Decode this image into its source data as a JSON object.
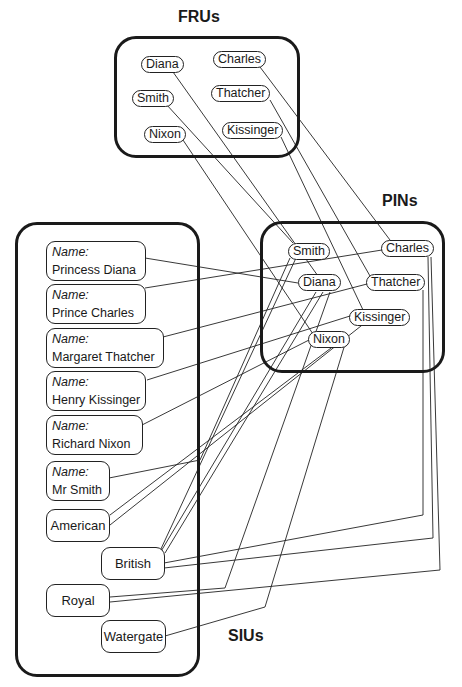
{
  "groups": {
    "frus": {
      "title": "FRUs"
    },
    "pins": {
      "title": "PINs"
    },
    "sius": {
      "title": "SIUs"
    }
  },
  "frus": {
    "diana": "Diana",
    "charles": "Charles",
    "smith": "Smith",
    "thatcher": "Thatcher",
    "nixon": "Nixon",
    "kissinger": "Kissinger"
  },
  "pins": {
    "smith": "Smith",
    "charles": "Charles",
    "diana": "Diana",
    "thatcher": "Thatcher",
    "kissinger": "Kissinger",
    "nixon": "Nixon"
  },
  "sius": {
    "name_label": "Name:",
    "names": [
      "Princess Diana",
      "Prince Charles",
      "Margaret Thatcher",
      "Henry Kissinger",
      "Richard Nixon",
      "Mr Smith"
    ],
    "attributes": {
      "american": "American",
      "british": "British",
      "royal": "Royal",
      "watergate": "Watergate"
    }
  },
  "edges": [
    {
      "from": "FRU:Diana",
      "to": "PIN:Diana"
    },
    {
      "from": "FRU:Charles",
      "to": "PIN:Charles"
    },
    {
      "from": "FRU:Smith",
      "to": "PIN:Smith"
    },
    {
      "from": "FRU:Thatcher",
      "to": "PIN:Thatcher"
    },
    {
      "from": "FRU:Nixon",
      "to": "PIN:Nixon"
    },
    {
      "from": "FRU:Kissinger",
      "to": "PIN:Kissinger"
    },
    {
      "from": "SIU:Princess Diana",
      "to": "PIN:Diana"
    },
    {
      "from": "SIU:Prince Charles",
      "to": "PIN:Charles"
    },
    {
      "from": "SIU:Margaret Thatcher",
      "to": "PIN:Thatcher"
    },
    {
      "from": "SIU:Henry Kissinger",
      "to": "PIN:Kissinger"
    },
    {
      "from": "SIU:Richard Nixon",
      "to": "PIN:Nixon"
    },
    {
      "from": "SIU:Mr Smith",
      "to": "PIN:Smith"
    },
    {
      "from": "SIU:American",
      "to": "PIN:Nixon"
    },
    {
      "from": "SIU:American",
      "to": "PIN:Kissinger"
    },
    {
      "from": "SIU:British",
      "to": "PIN:Smith"
    },
    {
      "from": "SIU:British",
      "to": "PIN:Diana"
    },
    {
      "from": "SIU:British",
      "to": "PIN:Thatcher"
    },
    {
      "from": "SIU:British",
      "to": "PIN:Charles"
    },
    {
      "from": "SIU:Royal",
      "to": "PIN:Diana"
    },
    {
      "from": "SIU:Royal",
      "to": "PIN:Charles"
    },
    {
      "from": "SIU:Watergate",
      "to": "PIN:Nixon"
    }
  ]
}
